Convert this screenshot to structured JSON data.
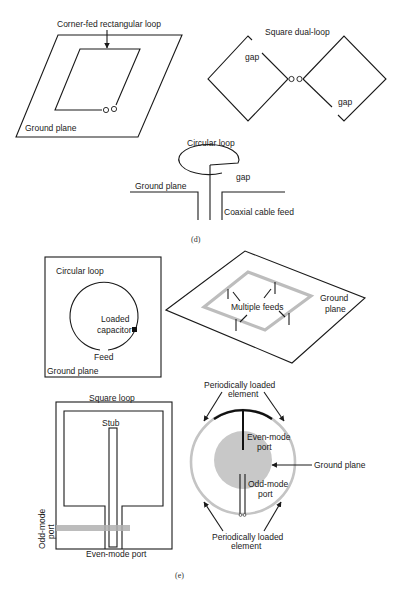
{
  "panel_d": {
    "caption": "(d)",
    "corner_fed": {
      "title": "Corner-fed rectangular loop",
      "ground_label": "Ground plane"
    },
    "dual_loop": {
      "title": "Square dual-loop",
      "gap_left": "gap",
      "gap_right": "gap"
    },
    "circular_coax": {
      "title": "Circular loop",
      "gap": "gap",
      "ground_label": "Ground plane",
      "feed_label": "Coaxial cable feed"
    }
  },
  "panel_e": {
    "caption": "(e)",
    "loaded_circular": {
      "title": "Circular loop",
      "capacitor_line1": "Loaded",
      "capacitor_line2": "capacitor",
      "feed_label": "Feed",
      "ground_label": "Ground plane"
    },
    "multi_feed": {
      "feeds_label": "Multiple feeds",
      "ground_line1": "Ground",
      "ground_line2": "plane"
    },
    "square_stub": {
      "title": "Square loop",
      "stub_label": "Stub",
      "odd_port_line1": "Odd-mode",
      "odd_port_line2": "port",
      "even_port_label": "Even-mode port"
    },
    "periodic_ring": {
      "top_label_line1": "Periodically loaded",
      "top_label_line2": "element",
      "even_line1": "Even-mode",
      "even_line2": "port",
      "odd_line1": "Odd-mode",
      "odd_line2": "port",
      "ground_label": "Ground plane",
      "bottom_label_line1": "Periodically loaded",
      "bottom_label_line2": "element"
    }
  },
  "colors": {
    "line": "#1a1a1a",
    "gray_loop": "#bdbdbd",
    "ground_disc": "#c8c8c8",
    "background": "#ffffff"
  }
}
